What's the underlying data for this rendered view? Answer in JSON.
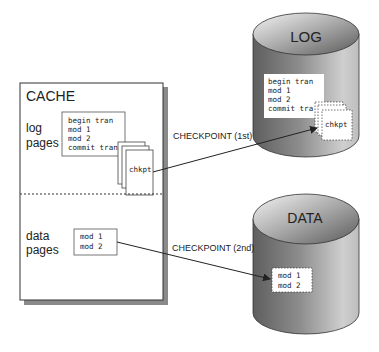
{
  "cache": {
    "title": "CACHE",
    "log_section": {
      "label_line1": "log",
      "label_line2": "pages",
      "log_lines": [
        "begin tran",
        "mod 1",
        "mod 2",
        "commit tran"
      ],
      "checkpoint_page": "chkpt"
    },
    "data_section": {
      "label_line1": "data",
      "label_line2": "pages",
      "data_lines": [
        "mod 1",
        "mod 2"
      ]
    }
  },
  "log_store": {
    "title": "LOG",
    "log_lines": [
      "begin tran",
      "mod 1",
      "mod 2",
      "commit tra"
    ],
    "checkpoint_page": "chkpt"
  },
  "data_store": {
    "title": "DATA",
    "data_lines": [
      "mod 1",
      "mod 2"
    ]
  },
  "arrows": {
    "first": "CHECKPOINT (1st)",
    "second": "CHECKPOINT (2nd)"
  },
  "colors": {
    "cylinder_dark": "#5a5a5a",
    "cylinder_light": "#d8d8d8",
    "shadow": "#8a8a8a",
    "line": "#222222"
  }
}
